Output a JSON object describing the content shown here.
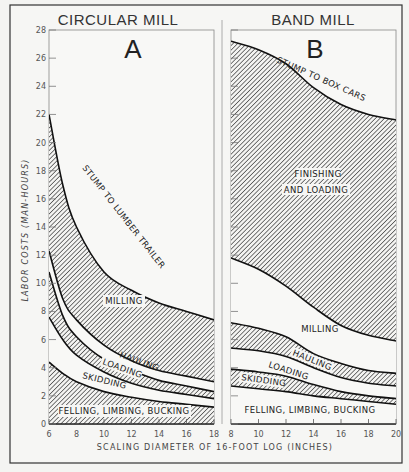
{
  "figure": {
    "x_axis_title": "SCALING DIAMETER OF 16-FOOT LOG (INCHES)",
    "y_axis_title": "LABOR COSTS (MAN-HOURS)",
    "panel_a": {
      "title": "CIRCULAR MILL",
      "letter": "A"
    },
    "panel_b": {
      "title": "BAND MILL",
      "letter": "B"
    }
  },
  "chart_data": [
    {
      "type": "area",
      "title": "CIRCULAR MILL",
      "panel": "A",
      "xlabel": "SCALING DIAMETER OF 16-FOOT LOG (INCHES)",
      "ylabel": "LABOR COSTS (MAN-HOURS)",
      "xlim": [
        6,
        18
      ],
      "ylim": [
        0,
        28
      ],
      "x_ticks": [
        6,
        8,
        10,
        12,
        14,
        16,
        18
      ],
      "y_ticks": [
        0,
        2,
        4,
        6,
        8,
        10,
        12,
        14,
        16,
        18,
        20,
        22,
        24,
        26,
        28
      ],
      "grid": false,
      "stacked": true,
      "x": [
        6,
        7,
        8,
        10,
        12,
        14,
        16,
        18
      ],
      "series": [
        {
          "name": "FELLING, LIMBING, BUCKING",
          "label": "FELLING, LIMBING, BUCKING",
          "hatched": true,
          "top": [
            4.4,
            3.6,
            3.0,
            2.3,
            1.9,
            1.6,
            1.4,
            1.2
          ]
        },
        {
          "name": "SKIDDING",
          "label": "SKIDDING",
          "hatched": false,
          "top": [
            7.6,
            6.0,
            4.9,
            3.7,
            2.9,
            2.4,
            2.1,
            1.8
          ]
        },
        {
          "name": "LOADING",
          "label": "LOADING",
          "hatched": true,
          "top": [
            10.8,
            7.7,
            6.2,
            4.6,
            3.8,
            3.1,
            2.7,
            2.3
          ]
        },
        {
          "name": "HAULING",
          "label": "HAULING",
          "hatched": false,
          "top": [
            12.3,
            8.9,
            7.4,
            5.6,
            4.5,
            3.8,
            3.4,
            3.0
          ]
        },
        {
          "name": "MILLING",
          "label": "MILLING",
          "hatched": true,
          "top": [
            22.0,
            17.0,
            14.0,
            10.8,
            9.5,
            8.6,
            8.0,
            7.4
          ]
        }
      ],
      "total_curve_label": "STUMP TO LUMBER TRAILER",
      "total": [
        22.0,
        17.0,
        14.0,
        10.8,
        9.5,
        8.6,
        8.0,
        7.4
      ]
    },
    {
      "type": "area",
      "title": "BAND MILL",
      "panel": "B",
      "xlabel": "SCALING DIAMETER OF 16-FOOT LOG (INCHES)",
      "ylabel": "LABOR COSTS (MAN-HOURS)",
      "xlim": [
        8,
        20
      ],
      "ylim": [
        0,
        28
      ],
      "x_ticks": [
        8,
        10,
        12,
        14,
        16,
        18,
        20
      ],
      "grid": false,
      "stacked": true,
      "x": [
        8,
        10,
        12,
        14,
        16,
        18,
        20
      ],
      "series": [
        {
          "name": "FELLING, LIMBING, BUCKING",
          "label": "FELLING, LIMBING, BUCKING",
          "hatched": false,
          "top": [
            2.7,
            2.5,
            2.3,
            2.0,
            1.8,
            1.6,
            1.4
          ]
        },
        {
          "name": "SKIDDING",
          "label": "SKIDDING",
          "hatched": true,
          "top": [
            3.9,
            3.7,
            3.4,
            2.8,
            2.3,
            2.0,
            1.8
          ]
        },
        {
          "name": "LOADING",
          "label": "LOADING",
          "hatched": false,
          "top": [
            5.4,
            5.2,
            4.8,
            4.0,
            3.3,
            2.9,
            2.7
          ]
        },
        {
          "name": "HAULING",
          "label": "HAULING",
          "hatched": true,
          "top": [
            7.2,
            6.8,
            6.2,
            5.0,
            4.3,
            3.8,
            3.6
          ]
        },
        {
          "name": "MILLING",
          "label": "MILLING",
          "hatched": false,
          "top": [
            11.8,
            11.0,
            9.8,
            8.3,
            7.0,
            6.3,
            5.9
          ]
        },
        {
          "name": "FINISHING AND LOADING",
          "label": "FINISHING AND LOADING",
          "hatched": true,
          "top": [
            27.2,
            26.6,
            25.6,
            23.9,
            22.7,
            22.0,
            21.6
          ]
        }
      ],
      "total_curve_label": "STUMP TO BOX CARS",
      "total": [
        27.2,
        26.6,
        25.6,
        23.9,
        22.7,
        22.0,
        21.6
      ]
    }
  ]
}
